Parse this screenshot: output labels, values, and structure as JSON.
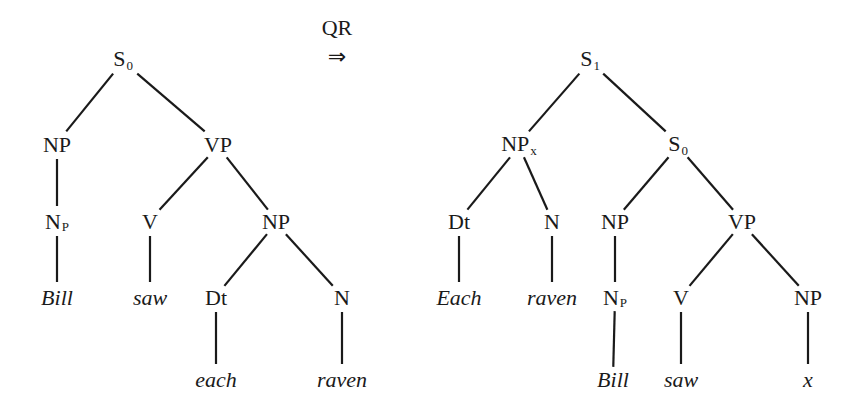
{
  "transformation": {
    "label": "QR",
    "arrow": "⇒"
  },
  "left_tree": {
    "nodes": [
      {
        "id": "S0",
        "cat": "S",
        "sub": "0",
        "x": 123,
        "y": 60,
        "word": false
      },
      {
        "id": "NP",
        "cat": "NP",
        "sub": "",
        "x": 57,
        "y": 145,
        "word": false
      },
      {
        "id": "VP",
        "cat": "VP",
        "sub": "",
        "x": 218,
        "y": 145,
        "word": false
      },
      {
        "id": "Np",
        "cat": "N",
        "sub": "P",
        "x": 57,
        "y": 222,
        "word": false
      },
      {
        "id": "V",
        "cat": "V",
        "sub": "",
        "x": 150,
        "y": 222,
        "word": false
      },
      {
        "id": "NP2",
        "cat": "NP",
        "sub": "",
        "x": 276,
        "y": 222,
        "word": false
      },
      {
        "id": "Bill",
        "cat": "Bill",
        "sub": "",
        "x": 57,
        "y": 298,
        "word": true
      },
      {
        "id": "saw",
        "cat": "saw",
        "sub": "",
        "x": 150,
        "y": 298,
        "word": true
      },
      {
        "id": "Dt",
        "cat": "Dt",
        "sub": "",
        "x": 216,
        "y": 298,
        "word": false
      },
      {
        "id": "N",
        "cat": "N",
        "sub": "",
        "x": 342,
        "y": 298,
        "word": false
      },
      {
        "id": "each",
        "cat": "each",
        "sub": "",
        "x": 216,
        "y": 380,
        "word": true
      },
      {
        "id": "raven",
        "cat": "raven",
        "sub": "",
        "x": 342,
        "y": 380,
        "word": true
      }
    ],
    "edges": [
      [
        "S0",
        "NP"
      ],
      [
        "S0",
        "VP"
      ],
      [
        "NP",
        "Np"
      ],
      [
        "VP",
        "V"
      ],
      [
        "VP",
        "NP2"
      ],
      [
        "Np",
        "Bill"
      ],
      [
        "V",
        "saw"
      ],
      [
        "NP2",
        "Dt"
      ],
      [
        "NP2",
        "N"
      ],
      [
        "Dt",
        "each"
      ],
      [
        "N",
        "raven"
      ]
    ]
  },
  "right_tree": {
    "nodes": [
      {
        "id": "S1",
        "cat": "S",
        "sub": "1",
        "x": 590,
        "y": 60,
        "word": false
      },
      {
        "id": "NPx",
        "cat": "NP",
        "sub": "x",
        "x": 519,
        "y": 145,
        "word": false
      },
      {
        "id": "S0",
        "cat": "S",
        "sub": "0",
        "x": 678,
        "y": 145,
        "word": false
      },
      {
        "id": "Dt",
        "cat": "Dt",
        "sub": "",
        "x": 459,
        "y": 222,
        "word": false
      },
      {
        "id": "N",
        "cat": "N",
        "sub": "",
        "x": 552,
        "y": 222,
        "word": false
      },
      {
        "id": "NP",
        "cat": "NP",
        "sub": "",
        "x": 615,
        "y": 222,
        "word": false
      },
      {
        "id": "VP",
        "cat": "VP",
        "sub": "",
        "x": 742,
        "y": 222,
        "word": false
      },
      {
        "id": "Each",
        "cat": "Each",
        "sub": "",
        "x": 459,
        "y": 298,
        "word": true
      },
      {
        "id": "raven",
        "cat": "raven",
        "sub": "",
        "x": 552,
        "y": 298,
        "word": true
      },
      {
        "id": "Np",
        "cat": "N",
        "sub": "P",
        "x": 615,
        "y": 298,
        "word": false
      },
      {
        "id": "V",
        "cat": "V",
        "sub": "",
        "x": 681,
        "y": 298,
        "word": false
      },
      {
        "id": "NP2",
        "cat": "NP",
        "sub": "",
        "x": 808,
        "y": 298,
        "word": false
      },
      {
        "id": "Bill",
        "cat": "Bill",
        "sub": "",
        "x": 613,
        "y": 380,
        "word": true
      },
      {
        "id": "saw",
        "cat": "saw",
        "sub": "",
        "x": 681,
        "y": 380,
        "word": true
      },
      {
        "id": "x",
        "cat": "x",
        "sub": "",
        "x": 808,
        "y": 380,
        "word": true
      }
    ],
    "edges": [
      [
        "S1",
        "NPx"
      ],
      [
        "S1",
        "S0"
      ],
      [
        "NPx",
        "Dt"
      ],
      [
        "NPx",
        "N"
      ],
      [
        "S0",
        "NP"
      ],
      [
        "S0",
        "VP"
      ],
      [
        "Dt",
        "Each"
      ],
      [
        "N",
        "raven"
      ],
      [
        "NP",
        "Np"
      ],
      [
        "VP",
        "V"
      ],
      [
        "VP",
        "NP2"
      ],
      [
        "Np",
        "Bill"
      ],
      [
        "V",
        "saw"
      ],
      [
        "NP2",
        "x"
      ]
    ]
  }
}
